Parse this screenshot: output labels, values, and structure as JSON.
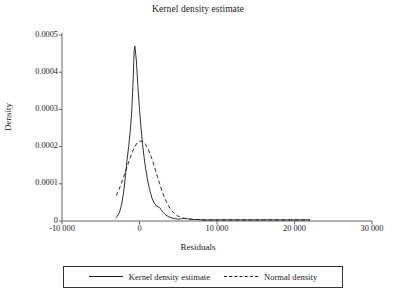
{
  "chart_data": {
    "type": "line",
    "title": "Kernel density estimate",
    "xlabel": "Residuals",
    "ylabel": "Density",
    "xlim": [
      -10000,
      30000
    ],
    "ylim": [
      0,
      0.0005
    ],
    "grid": false,
    "legend_position": "bottom",
    "xticks": [
      -10000,
      0,
      10000,
      20000,
      30000
    ],
    "xtick_labels": [
      "-10 000",
      "0",
      "10 000",
      "20 000",
      "30 000"
    ],
    "yticks": [
      0,
      0.0001,
      0.0002,
      0.0003,
      0.0004,
      0.0005
    ],
    "ytick_labels": [
      "0",
      "0.0001",
      "0.0002",
      "0.0003",
      "0.0004",
      "0.0005"
    ],
    "series": [
      {
        "name": "Kernel density estimate",
        "style": "solid",
        "color": "#1a1a1a",
        "x": [
          -3100,
          -2900,
          -2600,
          -2300,
          -2000,
          -1800,
          -1600,
          -1400,
          -1200,
          -1000,
          -800,
          -700,
          -600,
          -400,
          -200,
          0,
          200,
          400,
          600,
          800,
          1000,
          1300,
          1600,
          1900,
          2200,
          2400,
          2600,
          2800,
          3000,
          3400,
          3800,
          4200,
          4600,
          5000,
          5400,
          5800,
          6200,
          6600,
          7000,
          7600,
          8200,
          9000,
          10000,
          11000,
          12000,
          13000,
          14000,
          15000,
          16000,
          17000,
          18000,
          19000,
          20000,
          21000,
          22000
        ],
        "y": [
          8e-06,
          1.2e-05,
          2.2e-05,
          4.5e-05,
          8.5e-05,
          0.000125,
          0.000165,
          0.0002,
          0.00024,
          0.000295,
          0.00039,
          0.000455,
          0.00047,
          0.00043,
          0.00036,
          0.0003,
          0.00025,
          0.000205,
          0.00017,
          0.00014,
          0.000115,
          8.5e-05,
          6.2e-05,
          4.8e-05,
          4e-05,
          3.8e-05,
          3.6e-05,
          3e-05,
          2.4e-05,
          1.6e-05,
          1.1e-05,
          8e-06,
          6e-06,
          5e-06,
          6e-06,
          7e-06,
          6e-06,
          5e-06,
          4e-06,
          4e-06,
          3e-06,
          3e-06,
          3e-06,
          3e-06,
          3e-06,
          3e-06,
          3e-06,
          3e-06,
          3e-06,
          3e-06,
          3e-06,
          3e-06,
          3e-06,
          3e-06,
          3e-06
        ]
      },
      {
        "name": "Normal density",
        "style": "dashed",
        "color": "#1a1a1a",
        "x": [
          -3000,
          -2700,
          -2400,
          -2100,
          -1800,
          -1500,
          -1200,
          -900,
          -600,
          -300,
          0,
          200,
          500,
          800,
          1100,
          1400,
          1700,
          2000,
          2300,
          2600,
          2900,
          3200,
          3600,
          4000,
          4400,
          4800,
          5200,
          5600,
          6000,
          6500,
          7000,
          7600,
          8200,
          9000,
          10000,
          11000,
          12000,
          13000,
          14000,
          16000,
          18000,
          20000,
          22000
        ],
        "y": [
          6.8e-05,
          8.2e-05,
          9.8e-05,
          0.000115,
          0.000133,
          0.000152,
          0.00017,
          0.000187,
          0.0002,
          0.00021,
          0.000214,
          0.000215,
          0.000212,
          0.000205,
          0.000194,
          0.000179,
          0.000161,
          0.000141,
          0.00012,
          0.0001,
          8.1e-05,
          6.4e-05,
          4.6e-05,
          3.2e-05,
          2.2e-05,
          1.5e-05,
          1.1e-05,
          8e-06,
          6e-06,
          5e-06,
          4e-06,
          4e-06,
          3e-06,
          3e-06,
          3e-06,
          3e-06,
          3e-06,
          3e-06,
          3e-06,
          3e-06,
          3e-06,
          3e-06,
          3e-06
        ]
      }
    ]
  },
  "legend": {
    "items": [
      {
        "label": "Kernel density estimate",
        "style": "solid"
      },
      {
        "label": "Normal density",
        "style": "dashed"
      }
    ]
  }
}
